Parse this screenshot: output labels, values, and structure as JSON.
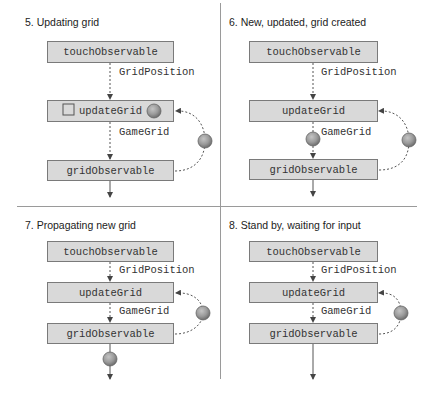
{
  "panels": [
    {
      "step": "5",
      "title": "5. Updating grid",
      "boxes": {
        "top": "touchObservable",
        "middle": "updateGrid",
        "bottom": "gridObservable"
      },
      "edge_labels": {
        "top_to_middle": "GridPosition",
        "middle_to_bottom": "GameGrid"
      },
      "tokens": [
        "square-in-updateGrid",
        "ball-in-updateGrid",
        "ball-on-feedback-loop"
      ]
    },
    {
      "step": "6",
      "title": "6. New, updated, grid created",
      "boxes": {
        "top": "touchObservable",
        "middle": "updateGrid",
        "bottom": "gridObservable"
      },
      "edge_labels": {
        "top_to_middle": "GridPosition",
        "middle_to_bottom": "GameGrid"
      },
      "tokens": [
        "ball-on-GameGrid-edge",
        "ball-on-feedback-loop"
      ]
    },
    {
      "step": "7",
      "title": "7. Propagating new grid",
      "boxes": {
        "top": "touchObservable",
        "middle": "updateGrid",
        "bottom": "gridObservable"
      },
      "edge_labels": {
        "top_to_middle": "GridPosition",
        "middle_to_bottom": "GameGrid"
      },
      "tokens": [
        "ball-on-feedback-loop",
        "ball-on-output-edge"
      ]
    },
    {
      "step": "8",
      "title": "8. Stand by, waiting for input",
      "boxes": {
        "top": "touchObservable",
        "middle": "updateGrid",
        "bottom": "gridObservable"
      },
      "edge_labels": {
        "top_to_middle": "GridPosition",
        "middle_to_bottom": "GameGrid"
      },
      "tokens": [
        "ball-on-feedback-loop"
      ]
    }
  ],
  "colors": {
    "box_fill": "#d9d9d9",
    "box_border": "#7a7a7a",
    "ball": "#9a9a9a",
    "ball_edge": "#6e6e6e",
    "divider": "#9a9a9a",
    "line": "#555555"
  }
}
